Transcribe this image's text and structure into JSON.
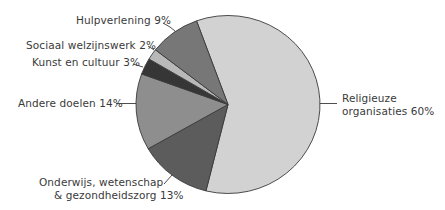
{
  "chart_data": {
    "type": "pie",
    "title": "",
    "start_angle_deg": -110,
    "direction": "clockwise",
    "slices": [
      {
        "label": "Religieuze organisaties",
        "value": 60,
        "color": "#d2d2d2"
      },
      {
        "label": "Onderwijs, wetenschap & gezondheidszorg",
        "value": 13,
        "color": "#5c5c5c"
      },
      {
        "label": "Andere doelen",
        "value": 14,
        "color": "#8e8e8e"
      },
      {
        "label": "Kunst en cultuur",
        "value": 3,
        "color": "#363636"
      },
      {
        "label": "Sociaal welzijnswerk",
        "value": 2,
        "color": "#b9b9b9"
      },
      {
        "label": "Hulpverlening",
        "value": 9,
        "color": "#777777"
      }
    ],
    "unit": "%",
    "legend": "none (direct labels with leader lines)"
  },
  "labels": {
    "religieuze_line1": "Religieuze",
    "religieuze_line2": "organisaties 60%",
    "onderwijs_line1": "Onderwijs, wetenschap",
    "onderwijs_line2": "& gezondheidszorg 13%",
    "andere": "Andere doelen 14%",
    "kunst": "Kunst en cultuur 3%",
    "sociaal": "Sociaal welzijnswerk 2%",
    "hulp": "Hulpverlening 9%"
  },
  "style": {
    "outline_color": "#3a3a3a",
    "leader_color": "#3a3a3a"
  }
}
